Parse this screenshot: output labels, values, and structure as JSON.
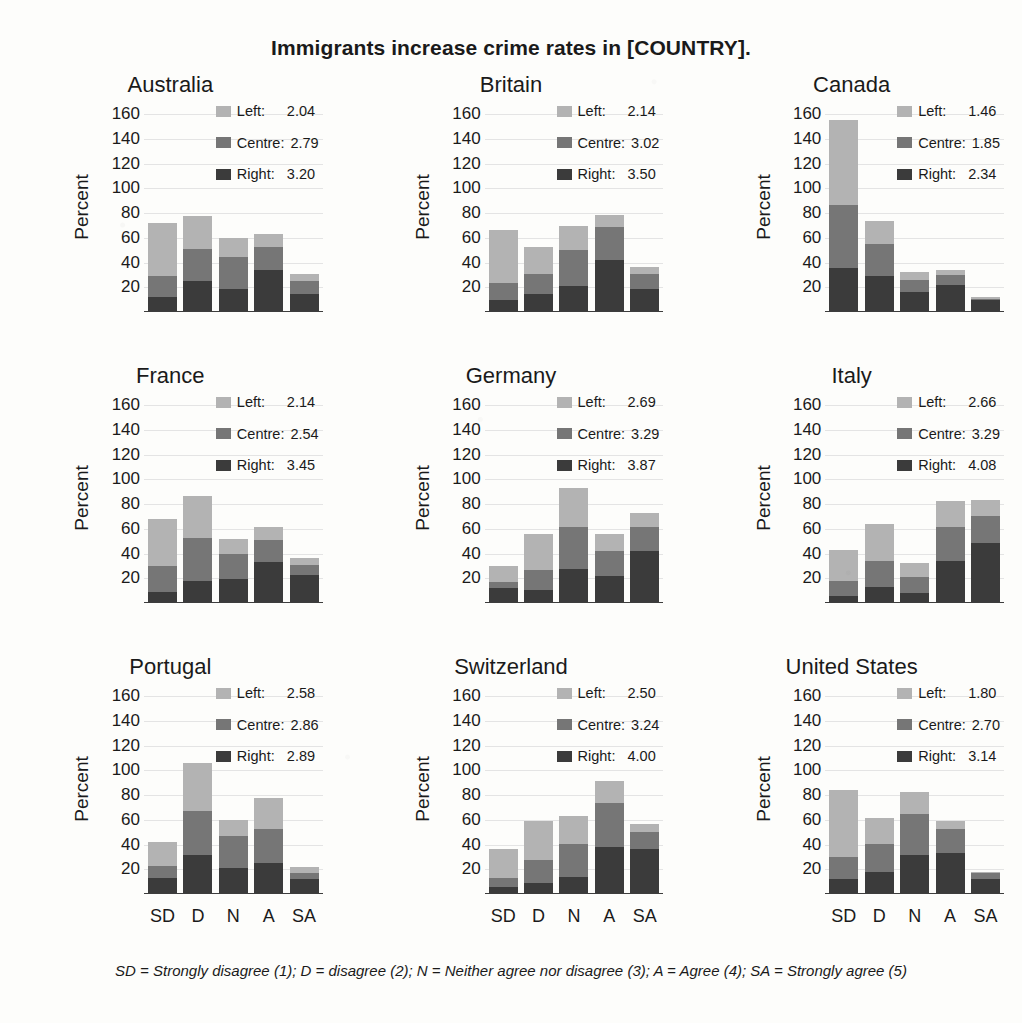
{
  "figure": {
    "title": "Immigrants increase crime rates in [COUNTRY].",
    "footnote": "SD = Strongly disagree (1); D = disagree (2); N = Neither agree nor disagree (3); A = Agree (4); SA = Strongly agree (5)",
    "ylabel": "Percent",
    "legend_labels": {
      "left": "Left:",
      "centre": "Centre:",
      "right": "Right:"
    },
    "colors": {
      "left": "#b3b3b3",
      "centre": "#767676",
      "right": "#3b3b3b",
      "axis": "#3d3d3d",
      "grid": "#c9c9d2"
    }
  },
  "chart_data": {
    "type": "bar",
    "title": "Immigrants increase crime rates in [COUNTRY].",
    "subtitle": "",
    "xlabel": "",
    "ylabel": "Percent",
    "ylim": [
      0,
      170
    ],
    "yticks": [
      20,
      40,
      60,
      80,
      100,
      120,
      140,
      160
    ],
    "grid": true,
    "stacked": true,
    "legend_position": "top-right inside panel",
    "categories": [
      "SD",
      "D",
      "N",
      "A",
      "SA"
    ],
    "category_definitions": {
      "SD": "Strongly disagree (1)",
      "D": "disagree (2)",
      "N": "Neither agree nor disagree (3)",
      "A": "Agree (4)",
      "SA": "Strongly agree (5)"
    },
    "series_names": [
      "Right",
      "Centre",
      "Left"
    ],
    "panels": [
      {
        "name": "Australia",
        "means": {
          "left": "2.04",
          "centre": "2.79",
          "right": "3.20"
        },
        "series": [
          {
            "name": "Right",
            "values": [
              11,
              24,
              18,
              33,
              14
            ]
          },
          {
            "name": "Centre",
            "values": [
              17,
              26,
              26,
              19,
              10
            ]
          },
          {
            "name": "Left",
            "values": [
              43,
              27,
              15,
              10,
              6
            ]
          }
        ],
        "totals": [
          71,
          77,
          59,
          62,
          30
        ]
      },
      {
        "name": "Britain",
        "means": {
          "left": "2.14",
          "centre": "3.02",
          "right": "3.50"
        },
        "series": [
          {
            "name": "Right",
            "values": [
              9,
              14,
              20,
              41,
              18
            ]
          },
          {
            "name": "Centre",
            "values": [
              14,
              16,
              29,
              27,
              12
            ]
          },
          {
            "name": "Left",
            "values": [
              43,
              22,
              20,
              10,
              6
            ]
          }
        ],
        "totals": [
          66,
          52,
          69,
          78,
          36
        ]
      },
      {
        "name": "Canada",
        "means": {
          "left": "1.46",
          "centre": "1.85",
          "right": "2.34"
        },
        "series": [
          {
            "name": "Right",
            "values": [
              35,
              28,
              15,
              21,
              9
            ]
          },
          {
            "name": "Centre",
            "values": [
              51,
              26,
              10,
              8,
              1
            ]
          },
          {
            "name": "Left",
            "values": [
              69,
              19,
              7,
              4,
              1
            ]
          }
        ],
        "totals": [
          155,
          73,
          32,
          33,
          11
        ]
      },
      {
        "name": "France",
        "means": {
          "left": "2.14",
          "centre": "2.54",
          "right": "3.45"
        },
        "series": [
          {
            "name": "Right",
            "values": [
              8,
              17,
              19,
              32,
              22
            ]
          },
          {
            "name": "Centre",
            "values": [
              21,
              35,
              20,
              18,
              8
            ]
          },
          {
            "name": "Left",
            "values": [
              38,
              34,
              12,
              11,
              6
            ]
          }
        ],
        "totals": [
          67,
          86,
          51,
          61,
          36
        ]
      },
      {
        "name": "Germany",
        "means": {
          "left": "2.69",
          "centre": "3.29",
          "right": "3.87"
        },
        "series": [
          {
            "name": "Right",
            "values": [
              11,
              10,
              27,
              21,
              41
            ]
          },
          {
            "name": "Centre",
            "values": [
              5,
              16,
              34,
              20,
              20
            ]
          },
          {
            "name": "Left",
            "values": [
              13,
              29,
              31,
              14,
              11
            ]
          }
        ],
        "totals": [
          29,
          55,
          92,
          55,
          72
        ]
      },
      {
        "name": "Italy",
        "means": {
          "left": "2.66",
          "centre": "3.29",
          "right": "4.08"
        },
        "series": [
          {
            "name": "Right",
            "values": [
              5,
              12,
              7,
              33,
              48
            ]
          },
          {
            "name": "Centre",
            "values": [
              12,
              21,
              13,
              28,
              22
            ]
          },
          {
            "name": "Left",
            "values": [
              25,
              30,
              12,
              21,
              13
            ]
          }
        ],
        "totals": [
          42,
          63,
          32,
          82,
          83
        ]
      },
      {
        "name": "Portugal",
        "means": {
          "left": "2.58",
          "centre": "2.86",
          "right": "2.89"
        },
        "series": [
          {
            "name": "Right",
            "values": [
              12,
              31,
              20,
              24,
              11
            ]
          },
          {
            "name": "Centre",
            "values": [
              10,
              35,
              26,
              28,
              5
            ]
          },
          {
            "name": "Left",
            "values": [
              19,
              39,
              13,
              25,
              5
            ]
          }
        ],
        "totals": [
          41,
          105,
          59,
          77,
          21
        ]
      },
      {
        "name": "Switzerland",
        "means": {
          "left": "2.50",
          "centre": "3.24",
          "right": "4.00"
        },
        "series": [
          {
            "name": "Right",
            "values": [
              5,
              8,
              13,
              37,
              36
            ]
          },
          {
            "name": "Centre",
            "values": [
              7,
              19,
              27,
              36,
              13
            ]
          },
          {
            "name": "Left",
            "values": [
              24,
              31,
              22,
              18,
              7
            ]
          }
        ],
        "totals": [
          36,
          58,
          62,
          91,
          56
        ]
      },
      {
        "name": "United States",
        "means": {
          "left": "1.80",
          "centre": "2.70",
          "right": "3.14"
        },
        "series": [
          {
            "name": "Right",
            "values": [
              11,
              17,
              31,
              32,
              11
            ]
          },
          {
            "name": "Centre",
            "values": [
              18,
              23,
              33,
              20,
              5
            ]
          },
          {
            "name": "Left",
            "values": [
              54,
              21,
              18,
              6,
              1
            ]
          }
        ],
        "totals": [
          83,
          61,
          82,
          58,
          17
        ]
      }
    ]
  }
}
